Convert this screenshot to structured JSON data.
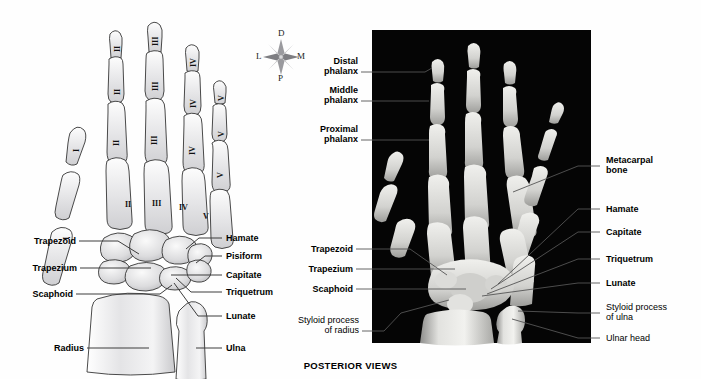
{
  "figure": {
    "caption": "POSTERIOR VIEWS",
    "panels": [
      {
        "id": "illustration",
        "kind": "line-drawing",
        "view": "posterior"
      },
      {
        "id": "radiograph",
        "kind": "x-ray",
        "view": "posterior"
      }
    ]
  },
  "compass": {
    "name": "orientation-rose",
    "up": "D",
    "right": "M",
    "down": "P",
    "left": "L"
  },
  "illustration": {
    "digit_numerals": {
      "distal": [
        "II",
        "III",
        "IV",
        "V"
      ],
      "middle": [
        "II",
        "III",
        "IV",
        "V"
      ],
      "proximal": [
        "I",
        "II",
        "III",
        "IV",
        "V"
      ],
      "metacarpal": [
        "I",
        "II",
        "III",
        "IV",
        "V"
      ]
    },
    "labels_left": [
      {
        "text": "Trapezoid",
        "bold": true
      },
      {
        "text": "Trapezium",
        "bold": true
      },
      {
        "text": "Scaphoid",
        "bold": true
      },
      {
        "text": "Radius",
        "bold": true
      }
    ],
    "labels_right": [
      {
        "text": "Hamate",
        "bold": true
      },
      {
        "text": "Pisiform",
        "bold": true
      },
      {
        "text": "Capitate",
        "bold": true
      },
      {
        "text": "Triquetrum",
        "bold": true
      },
      {
        "text": "Lunate",
        "bold": true
      },
      {
        "text": "Ulna",
        "bold": true
      }
    ]
  },
  "radiograph": {
    "labels_left": [
      {
        "text": "Distal\nphalanx",
        "bold": true
      },
      {
        "text": "Middle\nphalanx",
        "bold": true
      },
      {
        "text": "Proximal\nphalanx",
        "bold": true
      },
      {
        "text": "Trapezoid",
        "bold": true
      },
      {
        "text": "Trapezium",
        "bold": true
      },
      {
        "text": "Scaphoid",
        "bold": true
      },
      {
        "text": "Styloid process\nof radius",
        "bold": false
      }
    ],
    "labels_right": [
      {
        "text": "Metacarpal\nbone",
        "bold": true
      },
      {
        "text": "Hamate",
        "bold": true
      },
      {
        "text": "Capitate",
        "bold": true
      },
      {
        "text": "Triquetrum",
        "bold": true
      },
      {
        "text": "Lunate",
        "bold": true
      },
      {
        "text": "Styloid process\nof ulna",
        "bold": false
      },
      {
        "text": "Ulnar head",
        "bold": false
      }
    ]
  },
  "colors": {
    "background": "#ffffff",
    "xray_background": "#050505",
    "xray_bone": "#e8e8e6",
    "bone_fill": "#e9e9ea",
    "bone_outline": "#2b2b2b",
    "leader": "#3d3d3d",
    "text": "#000000"
  }
}
